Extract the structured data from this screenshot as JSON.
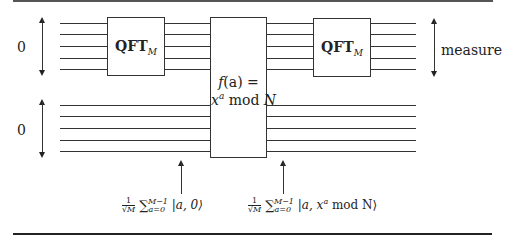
{
  "diagram": {
    "registers": [
      {
        "id": "first",
        "init_label": "0",
        "wires": 5
      },
      {
        "id": "second",
        "init_label": "0",
        "wires": 5
      }
    ],
    "gates": {
      "qft1": {
        "label": "QFT",
        "subscript": "M"
      },
      "oracle": {
        "line1_func": "f",
        "line1_arg": "(a) =",
        "line2_base": "x",
        "line2_exp": "a",
        "line2_rest": " mod ",
        "line2_N": "N"
      },
      "qft2": {
        "label": "QFT",
        "subscript": "M"
      }
    },
    "measure_label": "measure",
    "states": {
      "state1": {
        "frac_num": "1",
        "frac_den": "√M",
        "sum": "∑",
        "sum_sup": "M−1",
        "sum_sub": "a=0",
        "ket": " |a, 0⟩"
      },
      "state2": {
        "frac_num": "1",
        "frac_den": "√M",
        "sum": "∑",
        "sum_sup": "M−1",
        "sum_sub": "a=0",
        "ket": " |a, x",
        "ket_exp": "a",
        "ket_rest": " mod N⟩"
      }
    }
  }
}
